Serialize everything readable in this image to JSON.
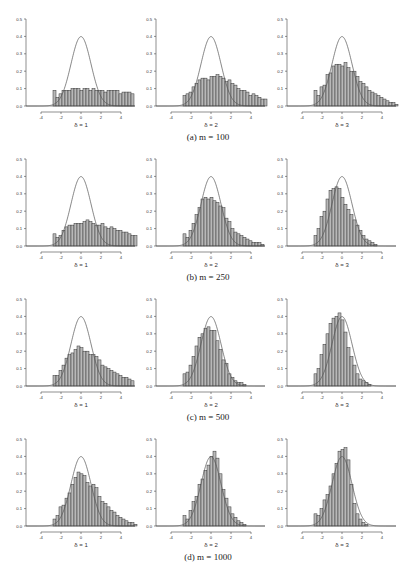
{
  "figure": {
    "captions": [
      "(a) m = 100",
      "(b) m = 250",
      "(c) m = 500",
      "(d) m = 1000"
    ],
    "xlabels": [
      "δ = 1",
      "δ = 2",
      "δ = 3"
    ],
    "xticks": [
      -4,
      -2,
      0,
      2,
      4
    ],
    "yticks": [
      0.0,
      0.1,
      0.2,
      0.3,
      0.4,
      0.5
    ],
    "bar_fill": "#b8b8b8",
    "bar_stroke": "#333333"
  },
  "chart_data": [
    {
      "type": "bar",
      "row": 0,
      "col": 0,
      "title": "(a) m = 100",
      "xlabel": "δ = 1",
      "ylabel": "",
      "xlim": [
        -5.5,
        5.4
      ],
      "ylim": [
        0,
        0.5
      ],
      "overlay": "standard normal density",
      "bin_start": -2.8,
      "bin_width": 0.3,
      "values": [
        0.09,
        0.05,
        0.07,
        0.09,
        0.09,
        0.09,
        0.1,
        0.1,
        0.1,
        0.09,
        0.1,
        0.1,
        0.09,
        0.1,
        0.09,
        0.09,
        0.09,
        0.08,
        0.09,
        0.09,
        0.09,
        0.09,
        0.07,
        0.08,
        0.08,
        0.08,
        0.07
      ]
    },
    {
      "type": "bar",
      "row": 0,
      "col": 1,
      "title": "(a) m = 100",
      "xlabel": "δ = 2",
      "ylabel": "",
      "xlim": [
        -5.5,
        5.4
      ],
      "ylim": [
        0,
        0.5
      ],
      "overlay": "standard normal density",
      "bin_start": -2.8,
      "bin_width": 0.3,
      "values": [
        0.06,
        0.07,
        0.08,
        0.11,
        0.13,
        0.15,
        0.16,
        0.16,
        0.15,
        0.17,
        0.17,
        0.18,
        0.17,
        0.16,
        0.14,
        0.15,
        0.13,
        0.12,
        0.1,
        0.09,
        0.09,
        0.08,
        0.06,
        0.07,
        0.06,
        0.05,
        0.04,
        0.04
      ]
    },
    {
      "type": "bar",
      "row": 0,
      "col": 2,
      "title": "(a) m = 100",
      "xlabel": "δ = 3",
      "ylabel": "",
      "xlim": [
        -5.5,
        5.4
      ],
      "ylim": [
        0,
        0.5
      ],
      "overlay": "standard normal density",
      "bin_start": -2.8,
      "bin_width": 0.3,
      "values": [
        0.09,
        0.06,
        0.11,
        0.12,
        0.18,
        0.19,
        0.23,
        0.24,
        0.24,
        0.23,
        0.25,
        0.22,
        0.2,
        0.2,
        0.17,
        0.14,
        0.13,
        0.11,
        0.09,
        0.08,
        0.07,
        0.06,
        0.05,
        0.04,
        0.03,
        0.02,
        0.02,
        0.01
      ]
    },
    {
      "type": "bar",
      "row": 1,
      "col": 0,
      "title": "(b) m = 250",
      "xlabel": "δ = 1",
      "ylabel": "",
      "xlim": [
        -5.5,
        5.4
      ],
      "ylim": [
        0,
        0.5
      ],
      "overlay": "standard normal density",
      "bin_start": -2.8,
      "bin_width": 0.3,
      "values": [
        0.07,
        0.05,
        0.06,
        0.09,
        0.11,
        0.12,
        0.12,
        0.13,
        0.13,
        0.13,
        0.14,
        0.15,
        0.14,
        0.13,
        0.12,
        0.12,
        0.13,
        0.11,
        0.1,
        0.11,
        0.1,
        0.09,
        0.09,
        0.08,
        0.08,
        0.07,
        0.06,
        0.06
      ]
    },
    {
      "type": "bar",
      "row": 1,
      "col": 1,
      "title": "(b) m = 250",
      "xlabel": "δ = 2",
      "ylabel": "",
      "xlim": [
        -5.5,
        5.4
      ],
      "ylim": [
        0,
        0.5
      ],
      "overlay": "standard normal density",
      "bin_start": -2.8,
      "bin_width": 0.3,
      "values": [
        0.07,
        0.05,
        0.09,
        0.13,
        0.18,
        0.22,
        0.27,
        0.28,
        0.27,
        0.28,
        0.26,
        0.25,
        0.23,
        0.22,
        0.16,
        0.14,
        0.1,
        0.08,
        0.07,
        0.06,
        0.05,
        0.04,
        0.03,
        0.02,
        0.02,
        0.02,
        0.01
      ]
    },
    {
      "type": "bar",
      "row": 1,
      "col": 2,
      "title": "(b) m = 250",
      "xlabel": "δ = 3",
      "ylabel": "",
      "xlim": [
        -5.5,
        5.4
      ],
      "ylim": [
        0,
        0.5
      ],
      "overlay": "standard normal density",
      "bin_start": -2.8,
      "bin_width": 0.3,
      "values": [
        0.06,
        0.1,
        0.17,
        0.2,
        0.27,
        0.32,
        0.33,
        0.34,
        0.33,
        0.28,
        0.24,
        0.21,
        0.18,
        0.15,
        0.12,
        0.09,
        0.06,
        0.04,
        0.03,
        0.02,
        0.01
      ]
    },
    {
      "type": "bar",
      "row": 2,
      "col": 0,
      "title": "(c) m = 500",
      "xlabel": "δ = 1",
      "ylabel": "",
      "xlim": [
        -5.5,
        5.4
      ],
      "ylim": [
        0,
        0.5
      ],
      "overlay": "standard normal density",
      "bin_start": -2.8,
      "bin_width": 0.3,
      "values": [
        0.06,
        0.06,
        0.09,
        0.12,
        0.16,
        0.18,
        0.19,
        0.21,
        0.23,
        0.22,
        0.2,
        0.2,
        0.18,
        0.18,
        0.17,
        0.15,
        0.12,
        0.11,
        0.1,
        0.09,
        0.08,
        0.07,
        0.06,
        0.05,
        0.05,
        0.04,
        0.03
      ]
    },
    {
      "type": "bar",
      "row": 2,
      "col": 1,
      "title": "(c) m = 500",
      "xlabel": "δ = 2",
      "ylabel": "",
      "xlim": [
        -5.5,
        5.4
      ],
      "ylim": [
        0,
        0.5
      ],
      "overlay": "standard normal density",
      "bin_start": -2.8,
      "bin_width": 0.3,
      "values": [
        0.07,
        0.08,
        0.12,
        0.17,
        0.23,
        0.28,
        0.3,
        0.33,
        0.34,
        0.32,
        0.32,
        0.26,
        0.21,
        0.15,
        0.13,
        0.07,
        0.05,
        0.03,
        0.02,
        0.02,
        0.01
      ]
    },
    {
      "type": "bar",
      "row": 2,
      "col": 2,
      "title": "(c) m = 500",
      "xlabel": "δ = 3",
      "ylabel": "",
      "xlim": [
        -5.5,
        5.4
      ],
      "ylim": [
        0,
        0.5
      ],
      "overlay": "standard normal density",
      "bin_start": -2.8,
      "bin_width": 0.3,
      "values": [
        0.07,
        0.1,
        0.18,
        0.24,
        0.3,
        0.36,
        0.39,
        0.4,
        0.42,
        0.38,
        0.31,
        0.22,
        0.17,
        0.12,
        0.07,
        0.04,
        0.03,
        0.02,
        0.01
      ]
    },
    {
      "type": "bar",
      "row": 3,
      "col": 0,
      "title": "(d) m = 1000",
      "xlabel": "δ = 1",
      "ylabel": "",
      "xlim": [
        -5.5,
        5.4
      ],
      "ylim": [
        0,
        0.5
      ],
      "overlay": "standard normal density",
      "bin_start": -2.8,
      "bin_width": 0.3,
      "values": [
        0.04,
        0.06,
        0.11,
        0.12,
        0.16,
        0.19,
        0.24,
        0.28,
        0.31,
        0.3,
        0.29,
        0.25,
        0.23,
        0.24,
        0.22,
        0.17,
        0.14,
        0.13,
        0.11,
        0.09,
        0.08,
        0.06,
        0.05,
        0.04,
        0.03,
        0.02,
        0.02,
        0.01
      ]
    },
    {
      "type": "bar",
      "row": 3,
      "col": 1,
      "title": "(d) m = 1000",
      "xlabel": "δ = 2",
      "ylabel": "",
      "xlim": [
        -5.5,
        5.4
      ],
      "ylim": [
        0,
        0.5
      ],
      "overlay": "standard normal density",
      "bin_start": -2.8,
      "bin_width": 0.3,
      "values": [
        0.06,
        0.04,
        0.09,
        0.14,
        0.17,
        0.24,
        0.27,
        0.32,
        0.35,
        0.4,
        0.43,
        0.39,
        0.3,
        0.21,
        0.16,
        0.11,
        0.07,
        0.05,
        0.03,
        0.02,
        0.01
      ]
    },
    {
      "type": "bar",
      "row": 3,
      "col": 2,
      "title": "(d) m = 1000",
      "xlabel": "δ = 3",
      "ylabel": "",
      "xlim": [
        -5.5,
        5.4
      ],
      "ylim": [
        0,
        0.5
      ],
      "overlay": "standard normal density",
      "bin_start": -2.8,
      "bin_width": 0.3,
      "values": [
        0.07,
        0.06,
        0.1,
        0.15,
        0.18,
        0.23,
        0.3,
        0.36,
        0.43,
        0.44,
        0.45,
        0.38,
        0.24,
        0.13,
        0.07,
        0.04,
        0.02,
        0.01
      ]
    }
  ]
}
